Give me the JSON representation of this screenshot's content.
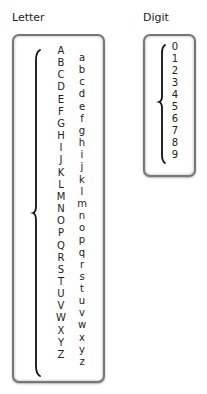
{
  "letter": {
    "label": "Letter",
    "uppercase": [
      "A",
      "B",
      "C",
      "D",
      "E",
      "F",
      "G",
      "H",
      "I",
      "J",
      "K",
      "L",
      "M",
      "N",
      "O",
      "P",
      "Q",
      "R",
      "S",
      "T",
      "U",
      "V",
      "W",
      "X",
      "Y",
      "Z"
    ],
    "lowercase": [
      "a",
      "b",
      "c",
      "d",
      "e",
      "f",
      "g",
      "h",
      "i",
      "j",
      "k",
      "l",
      "m",
      "n",
      "o",
      "p",
      "q",
      "r",
      "s",
      "t",
      "u",
      "v",
      "w",
      "x",
      "y",
      "z"
    ]
  },
  "digit": {
    "label": "Digit",
    "values": [
      "0",
      "1",
      "2",
      "3",
      "4",
      "5",
      "6",
      "7",
      "8",
      "9"
    ]
  }
}
